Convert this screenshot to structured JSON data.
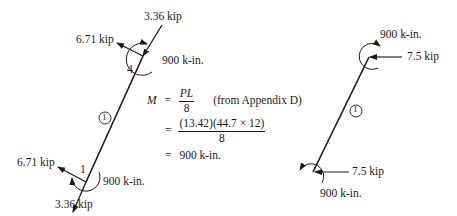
{
  "left_member": {
    "member_id": "1",
    "top_joint": "4",
    "bottom_joint": "1",
    "top_axial_force": "3.36 kip",
    "top_shear_force": "6.71 kip",
    "top_moment": "900 k-in.",
    "bottom_axial_force": "3.36 kip",
    "bottom_shear_force": "6.71 kip",
    "bottom_moment": "900 k-in."
  },
  "equation": {
    "lhs": "M",
    "eq1": "=",
    "num1": "PL",
    "den1": "8",
    "note": "(from Appendix D)",
    "eq2": "=",
    "num2": "(13.42)(44.7 × 12)",
    "den2": "8",
    "eq3": "=",
    "result": "900 k-in."
  },
  "right_member": {
    "member_id": "1",
    "top_moment": "900 k-in.",
    "top_horizontal_force": "7.5 kip",
    "bottom_horizontal_force": "7.5 kip",
    "bottom_moment": "900 k-in."
  }
}
